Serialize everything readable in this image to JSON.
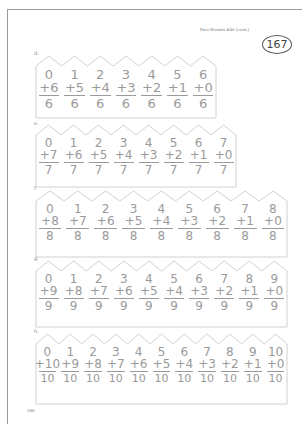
{
  "header": {
    "title": "Fact Houses #40 (cont.)",
    "page_number": "167"
  },
  "footer": {
    "page_number": "166"
  },
  "houses": [
    {
      "label": "d.",
      "total": "6",
      "facts": [
        {
          "top": "0",
          "addend": "+6",
          "sum": "6"
        },
        {
          "top": "1",
          "addend": "+5",
          "sum": "6"
        },
        {
          "top": "2",
          "addend": "+4",
          "sum": "6"
        },
        {
          "top": "3",
          "addend": "+3",
          "sum": "6"
        },
        {
          "top": "4",
          "addend": "+2",
          "sum": "6"
        },
        {
          "top": "5",
          "addend": "+1",
          "sum": "6"
        },
        {
          "top": "6",
          "addend": "+0",
          "sum": "6"
        }
      ]
    },
    {
      "label": "e.",
      "total": "7",
      "facts": [
        {
          "top": "0",
          "addend": "+7",
          "sum": "7"
        },
        {
          "top": "1",
          "addend": "+6",
          "sum": "7"
        },
        {
          "top": "2",
          "addend": "+5",
          "sum": "7"
        },
        {
          "top": "3",
          "addend": "+4",
          "sum": "7"
        },
        {
          "top": "4",
          "addend": "+3",
          "sum": "7"
        },
        {
          "top": "5",
          "addend": "+2",
          "sum": "7"
        },
        {
          "top": "6",
          "addend": "+1",
          "sum": "7"
        },
        {
          "top": "7",
          "addend": "+0",
          "sum": "7"
        }
      ]
    },
    {
      "label": "f.",
      "total": "8",
      "facts": [
        {
          "top": "0",
          "addend": "+8",
          "sum": "8"
        },
        {
          "top": "1",
          "addend": "+7",
          "sum": "8"
        },
        {
          "top": "2",
          "addend": "+6",
          "sum": "8"
        },
        {
          "top": "3",
          "addend": "+5",
          "sum": "8"
        },
        {
          "top": "4",
          "addend": "+4",
          "sum": "8"
        },
        {
          "top": "5",
          "addend": "+3",
          "sum": "8"
        },
        {
          "top": "6",
          "addend": "+2",
          "sum": "8"
        },
        {
          "top": "7",
          "addend": "+1",
          "sum": "8"
        },
        {
          "top": "8",
          "addend": "+0",
          "sum": "8"
        }
      ]
    },
    {
      "label": "g.",
      "total": "9",
      "facts": [
        {
          "top": "0",
          "addend": "+9",
          "sum": "9"
        },
        {
          "top": "1",
          "addend": "+8",
          "sum": "9"
        },
        {
          "top": "2",
          "addend": "+7",
          "sum": "9"
        },
        {
          "top": "3",
          "addend": "+6",
          "sum": "9"
        },
        {
          "top": "4",
          "addend": "+5",
          "sum": "9"
        },
        {
          "top": "5",
          "addend": "+4",
          "sum": "9"
        },
        {
          "top": "6",
          "addend": "+3",
          "sum": "9"
        },
        {
          "top": "7",
          "addend": "+2",
          "sum": "9"
        },
        {
          "top": "8",
          "addend": "+1",
          "sum": "9"
        },
        {
          "top": "9",
          "addend": "+0",
          "sum": "9"
        }
      ]
    },
    {
      "label": "h.",
      "total": "10",
      "facts": [
        {
          "top": "0",
          "addend": "+10",
          "sum": "10"
        },
        {
          "top": "1",
          "addend": "+9",
          "sum": "10"
        },
        {
          "top": "2",
          "addend": "+8",
          "sum": "10"
        },
        {
          "top": "3",
          "addend": "+7",
          "sum": "10"
        },
        {
          "top": "4",
          "addend": "+6",
          "sum": "10"
        },
        {
          "top": "5",
          "addend": "+5",
          "sum": "10"
        },
        {
          "top": "6",
          "addend": "+4",
          "sum": "10"
        },
        {
          "top": "7",
          "addend": "+3",
          "sum": "10"
        },
        {
          "top": "8",
          "addend": "+2",
          "sum": "10"
        },
        {
          "top": "9",
          "addend": "+1",
          "sum": "10"
        },
        {
          "top": "10",
          "addend": "+0",
          "sum": "10"
        }
      ]
    }
  ],
  "colors": {
    "ink": "#9a9a9a",
    "frame": "#9a9a9a",
    "badge": "#555555"
  }
}
